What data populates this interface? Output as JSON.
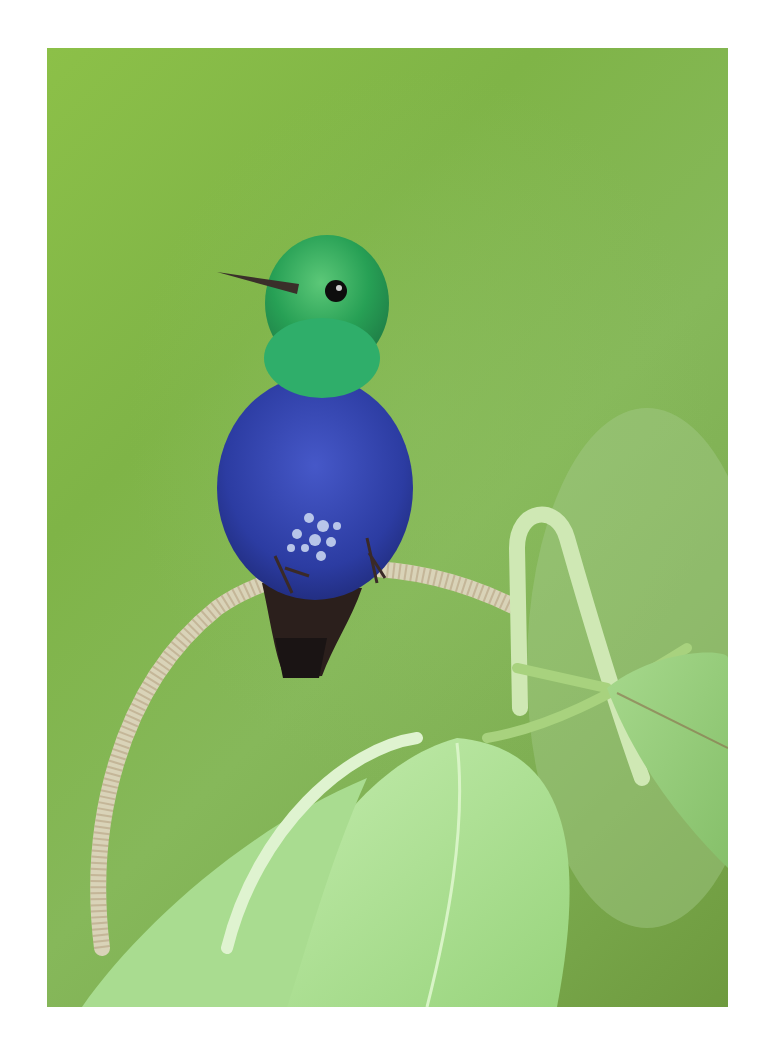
{
  "image": {
    "subject": "Hummingbird perched on a looped plant stem",
    "description": "A small hummingbird with an iridescent green head and throat, deep violet-blue breast and belly speckled white near the vent, dark tail, perched on a curled pale stem above large light-green leaves against a soft blurred green background.",
    "elements": [
      {
        "name": "hummingbird",
        "parts": [
          "green-head",
          "black-eye",
          "thin-dark-bill",
          "blue-violet-breast",
          "dark-tail",
          "feet-gripping-stem"
        ]
      },
      {
        "name": "looped-stem",
        "description": "pale, finely ringed curved stem forming a loop"
      },
      {
        "name": "leaves",
        "description": "large pale-green leaves with visible veins in lower half"
      },
      {
        "name": "hooked-sprout",
        "description": "pale green stalk curling over at right"
      }
    ],
    "colors": {
      "background": "#82b34c",
      "background_dark": "#6e9a3e",
      "head_green": "#2fa85a",
      "breast_blue": "#2f3fa8",
      "vent_white": "#c8d8f0",
      "tail_dark": "#2a1e1a",
      "stem": "#d8d2b8",
      "leaf": "#a8dc8c",
      "leaf_light": "#c6ecb0"
    },
    "frame": {
      "left": 47,
      "top": 48,
      "width": 681,
      "height": 959
    }
  }
}
